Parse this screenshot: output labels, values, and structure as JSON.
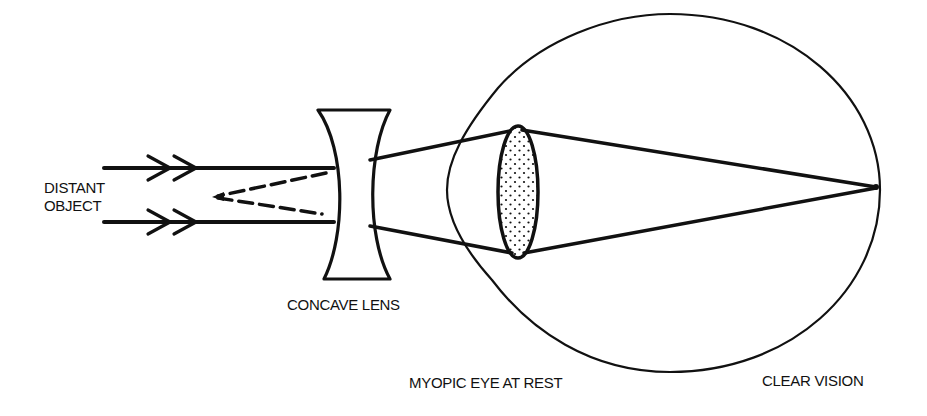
{
  "diagram": {
    "labels": {
      "object_line1": "DISTANT",
      "object_line2": "OBJECT",
      "lens": "CONCAVE LENS",
      "eye": "MYOPIC EYE AT REST",
      "result": "CLEAR VISION"
    },
    "colors": {
      "ink": "#111111",
      "background": "#ffffff"
    },
    "elements": [
      {
        "name": "incoming-parallel-rays",
        "count": 2,
        "arrowheads": "double chevron"
      },
      {
        "name": "virtual-divergence-lines",
        "style": "dashed",
        "converge_to": "virtual focus left of lens"
      },
      {
        "name": "concave-lens"
      },
      {
        "name": "diverging-rays"
      },
      {
        "name": "eye-crystalline-lens",
        "fill": "stippled"
      },
      {
        "name": "eyeball-outline-with-cornea"
      },
      {
        "name": "focal-point-on-retina"
      }
    ]
  }
}
